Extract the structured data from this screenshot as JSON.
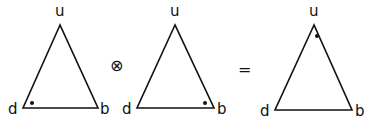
{
  "diagram": {
    "triangles": [
      {
        "id": "left",
        "labels": {
          "top": "u",
          "left": "d",
          "right": "b"
        },
        "vertices": {
          "top": [
            60,
            25
          ],
          "left": [
            23,
            108
          ],
          "right": [
            98,
            108
          ]
        },
        "dot": {
          "corner": "left",
          "pos": [
            32,
            103
          ]
        }
      },
      {
        "id": "middle",
        "labels": {
          "top": "u",
          "left": "d",
          "right": "b"
        },
        "vertices": {
          "top": [
            175,
            25
          ],
          "left": [
            137,
            108
          ],
          "right": [
            214,
            108
          ]
        },
        "dot": {
          "corner": "right",
          "pos": [
            205,
            103
          ]
        }
      },
      {
        "id": "result",
        "labels": {
          "top": "u",
          "left": "d",
          "right": "b"
        },
        "vertices": {
          "top": [
            314,
            25
          ],
          "left": [
            275,
            110
          ],
          "right": [
            352,
            110
          ]
        },
        "dot": {
          "corner": "top",
          "pos": [
            317,
            36
          ]
        }
      }
    ],
    "operators": {
      "tensor": "⊗",
      "equals": "="
    },
    "colors": {
      "stroke": "#111111",
      "background": "#ffffff"
    }
  }
}
